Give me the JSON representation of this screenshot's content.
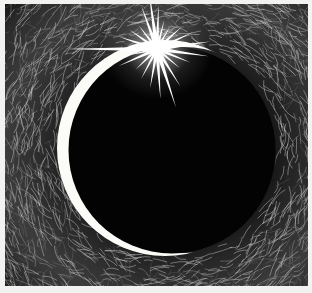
{
  "artwork": {
    "title": "Eclipse with Star Flare",
    "medium": "scratchboard engraving",
    "style": "cross-hatched radiating line engraving",
    "orientation": "landscape",
    "frame": {
      "canvas_width": 312,
      "canvas_height": 293,
      "border_color": "#f2f2f0",
      "border_width_px": 5,
      "plate_x": 5,
      "plate_y": 4,
      "plate_width": 303,
      "plate_height": 282
    },
    "palette": {
      "background_dark": "#050505",
      "sky_mid": "#3a3a3a",
      "sky_light": "#8a8a8a",
      "hatch_line": "#d8d8d8",
      "disc_black": "#030303",
      "crescent_white": "#fbfbf8",
      "star_white": "#ffffff"
    },
    "elements": [
      {
        "name": "dark-disc",
        "label": "Eclipsed solar disc",
        "shape": "circle",
        "center_x": 171,
        "center_y": 150,
        "radius": 105,
        "fill": "#030303"
      },
      {
        "name": "crescent",
        "label": "Illuminated crescent limb",
        "shape": "crescent",
        "outer_center_x": 160,
        "outer_center_y": 148,
        "outer_radius": 108,
        "inner_center_x": 178,
        "inner_center_y": 150,
        "inner_radius": 103,
        "tip_top_x": 152,
        "tip_top_y": 48,
        "tip_bottom_x": 166,
        "tip_bottom_y": 234,
        "fill": "#fbfbf8"
      },
      {
        "name": "star-flare",
        "label": "Bright star burst at limb",
        "shape": "multi-ray-star",
        "center_x": 156,
        "center_y": 48,
        "ray_count": 14,
        "long_ray_length": 96,
        "short_ray_length": 34,
        "core_radius": 6,
        "fill": "#ffffff"
      },
      {
        "name": "sky-hatching",
        "label": "Radiating cross-hatch corona texture",
        "shape": "line-field",
        "line_count": 520,
        "stroke": "#c9c9c9"
      }
    ],
    "composition_notes": {
      "light_source": "star at upper-left limb of disc",
      "crescent_side": "left",
      "texture_flow": "concentric arcs radiating outward from the disc"
    }
  }
}
